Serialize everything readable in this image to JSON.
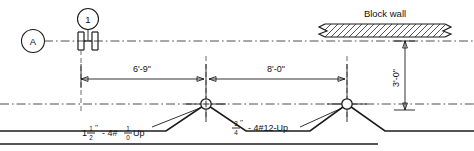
{
  "drawing": {
    "title_elements": {
      "block_wall_label": "Block wall"
    },
    "grid_bubbles": [
      {
        "name": "grid-bubble-1",
        "label": "1",
        "cx": 88,
        "cy": 19,
        "r": 10.5
      },
      {
        "name": "grid-bubble-a",
        "label": "A",
        "cx": 33,
        "cy": 41,
        "r": 11.5
      }
    ],
    "dimensions": [
      {
        "name": "dim-horizontal-left",
        "text": "6'-9''",
        "x1": 81,
        "x2": 204,
        "y": 79,
        "label_x": 142,
        "label_y": 72
      },
      {
        "name": "dim-horizontal-right",
        "text": "8'-0''",
        "x1": 207,
        "x2": 345,
        "y": 79,
        "label_x": 276,
        "label_y": 72
      },
      {
        "name": "dim-vertical-right",
        "text": "3'-0''",
        "x": 405,
        "y1": 46,
        "y2": 108,
        "label_x": 399,
        "label_y": 77,
        "rotated": true
      }
    ],
    "annotations": [
      {
        "name": "conduit-note-left",
        "whole": "1",
        "frac_num": "1",
        "frac_den": "2",
        "inch_mark": "''",
        "mid": "- 4#",
        "frac2_num": "1",
        "frac2_den": "0",
        "suffix": "Up",
        "x": 82,
        "y": 134
      },
      {
        "name": "conduit-note-right",
        "frac_num": "3",
        "frac_den": "4",
        "inch_mark": "''",
        "text": "- 4#12-Up",
        "x": 232,
        "y": 130
      }
    ],
    "nodes": [
      {
        "name": "junction-node-crossed",
        "cx": 206,
        "cy": 104,
        "r": 5.2,
        "style": "crosshair"
      },
      {
        "name": "junction-node-open",
        "cx": 347,
        "cy": 104,
        "r": 5.2,
        "style": "open"
      }
    ],
    "block_wall": {
      "name": "block-wall",
      "label": "Block wall",
      "label_x": 385,
      "label_y": 17,
      "x": 320,
      "y": 24,
      "width": 128,
      "height": 13
    },
    "colors": {
      "line": "#1c1c1c",
      "centerline": "#3a3a3a",
      "background": "#ffffff",
      "text": "#111111"
    }
  }
}
